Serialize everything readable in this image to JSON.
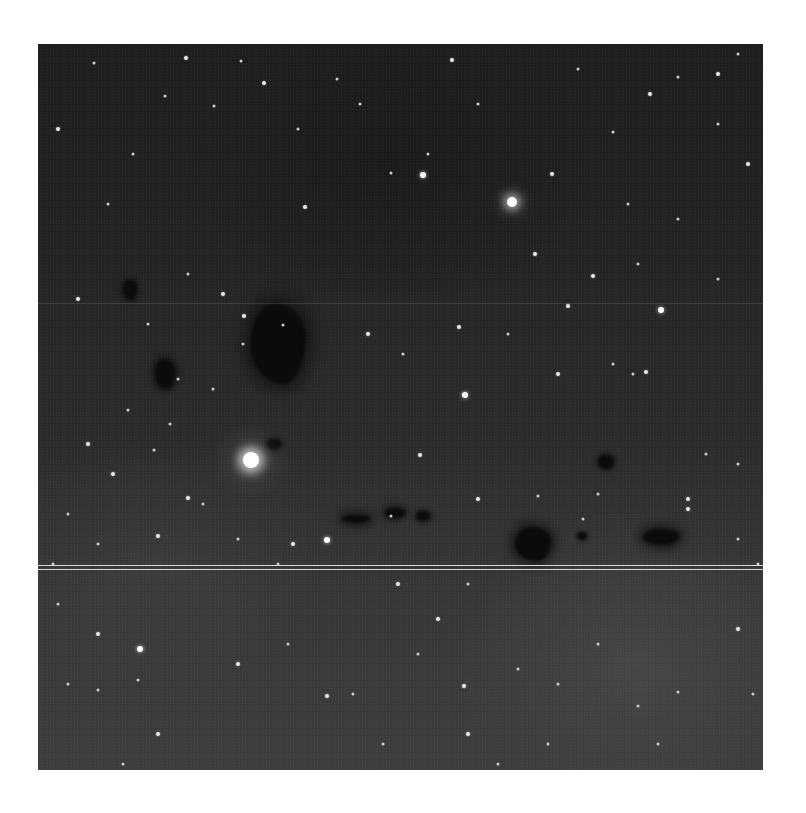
{
  "image": {
    "description": "Grayscale astronomical photograph of a star field with dark nebulae (Bok globules)",
    "frame": {
      "left": 38,
      "top": 44,
      "width": 725,
      "height": 726
    },
    "colors": {
      "sky_top": "#1c1c1c",
      "sky_bottom": "#3b3b3b",
      "star": "#ffffff",
      "nebula": "#0b0b0b",
      "border": "#ffffff"
    },
    "scanlines": [
      {
        "y": 259,
        "style": "faint"
      },
      {
        "y": 521,
        "style": "solid"
      },
      {
        "y": 525,
        "style": "solid"
      }
    ],
    "bright_stars": [
      {
        "x": 213,
        "y": 416,
        "size": 5
      },
      {
        "x": 474,
        "y": 158,
        "size": 4
      },
      {
        "x": 385,
        "y": 131,
        "size": 3
      },
      {
        "x": 623,
        "y": 266,
        "size": 3
      },
      {
        "x": 289,
        "y": 496,
        "size": 3
      },
      {
        "x": 427,
        "y": 351,
        "size": 3
      },
      {
        "x": 421,
        "y": 283,
        "size": 2
      },
      {
        "x": 497,
        "y": 210,
        "size": 2
      },
      {
        "x": 382,
        "y": 411,
        "size": 2
      },
      {
        "x": 206,
        "y": 272,
        "size": 2
      },
      {
        "x": 102,
        "y": 605,
        "size": 3
      },
      {
        "x": 289,
        "y": 652,
        "size": 2
      },
      {
        "x": 426,
        "y": 642,
        "size": 2
      },
      {
        "x": 330,
        "y": 728,
        "size": 2
      }
    ],
    "faint_stars": [
      [
        20,
        85
      ],
      [
        56,
        19
      ],
      [
        127,
        52
      ],
      [
        148,
        14
      ],
      [
        176,
        62
      ],
      [
        203,
        17
      ],
      [
        226,
        39
      ],
      [
        260,
        85
      ],
      [
        299,
        35
      ],
      [
        267,
        163
      ],
      [
        322,
        60
      ],
      [
        353,
        129
      ],
      [
        414,
        16
      ],
      [
        390,
        110
      ],
      [
        440,
        60
      ],
      [
        514,
        130
      ],
      [
        540,
        25
      ],
      [
        575,
        88
      ],
      [
        612,
        50
      ],
      [
        640,
        33
      ],
      [
        680,
        80
      ],
      [
        710,
        120
      ],
      [
        590,
        160
      ],
      [
        640,
        175
      ],
      [
        555,
        232
      ],
      [
        600,
        220
      ],
      [
        680,
        235
      ],
      [
        530,
        262
      ],
      [
        70,
        160
      ],
      [
        95,
        110
      ],
      [
        40,
        255
      ],
      [
        110,
        280
      ],
      [
        150,
        230
      ],
      [
        185,
        250
      ],
      [
        205,
        300
      ],
      [
        245,
        281
      ],
      [
        330,
        290
      ],
      [
        365,
        310
      ],
      [
        470,
        290
      ],
      [
        520,
        330
      ],
      [
        575,
        320
      ],
      [
        595,
        330
      ],
      [
        608,
        328
      ],
      [
        668,
        410
      ],
      [
        560,
        450
      ],
      [
        650,
        455
      ],
      [
        700,
        420
      ],
      [
        30,
        470
      ],
      [
        75,
        430
      ],
      [
        116,
        406
      ],
      [
        132,
        380
      ],
      [
        150,
        454
      ],
      [
        165,
        460
      ],
      [
        200,
        495
      ],
      [
        255,
        500
      ],
      [
        240,
        520
      ],
      [
        353,
        472
      ],
      [
        440,
        455
      ],
      [
        500,
        452
      ],
      [
        545,
        475
      ],
      [
        650,
        465
      ],
      [
        700,
        495
      ],
      [
        90,
        366
      ],
      [
        50,
        400
      ],
      [
        140,
        335
      ],
      [
        175,
        345
      ],
      [
        120,
        492
      ],
      [
        60,
        500
      ],
      [
        20,
        560
      ],
      [
        60,
        590
      ],
      [
        100,
        636
      ],
      [
        60,
        646
      ],
      [
        120,
        690
      ],
      [
        85,
        720
      ],
      [
        250,
        600
      ],
      [
        200,
        620
      ],
      [
        315,
        650
      ],
      [
        345,
        700
      ],
      [
        430,
        690
      ],
      [
        480,
        625
      ],
      [
        510,
        700
      ],
      [
        545,
        748
      ],
      [
        600,
        662
      ],
      [
        640,
        648
      ],
      [
        700,
        585
      ],
      [
        720,
        520
      ],
      [
        715,
        650
      ],
      [
        670,
        730
      ],
      [
        560,
        600
      ],
      [
        620,
        700
      ],
      [
        400,
        575
      ],
      [
        430,
        540
      ],
      [
        460,
        720
      ],
      [
        360,
        540
      ],
      [
        380,
        610
      ],
      [
        520,
        640
      ],
      [
        585,
        738
      ],
      [
        30,
        640
      ],
      [
        15,
        520
      ],
      [
        680,
        30
      ],
      [
        700,
        10
      ]
    ],
    "dark_nebulae": [
      {
        "x": 240,
        "y": 300,
        "w": 55,
        "h": 80,
        "shape": "large globule"
      },
      {
        "x": 92,
        "y": 246,
        "w": 14,
        "h": 20,
        "shape": "small wedge"
      },
      {
        "x": 127,
        "y": 330,
        "w": 20,
        "h": 30,
        "shape": "elongated"
      },
      {
        "x": 236,
        "y": 400,
        "w": 14,
        "h": 10,
        "shape": "blob"
      },
      {
        "x": 495,
        "y": 500,
        "w": 36,
        "h": 34,
        "shape": "comet-like"
      },
      {
        "x": 623,
        "y": 493,
        "w": 36,
        "h": 16,
        "shape": "irregular"
      },
      {
        "x": 568,
        "y": 418,
        "w": 16,
        "h": 14,
        "shape": "blob"
      },
      {
        "x": 318,
        "y": 475,
        "w": 28,
        "h": 8,
        "shape": "filament"
      },
      {
        "x": 357,
        "y": 469,
        "w": 20,
        "h": 10,
        "shape": "filament"
      },
      {
        "x": 385,
        "y": 472,
        "w": 14,
        "h": 10,
        "shape": "blob"
      },
      {
        "x": 544,
        "y": 492,
        "w": 10,
        "h": 8,
        "shape": "small"
      }
    ]
  }
}
